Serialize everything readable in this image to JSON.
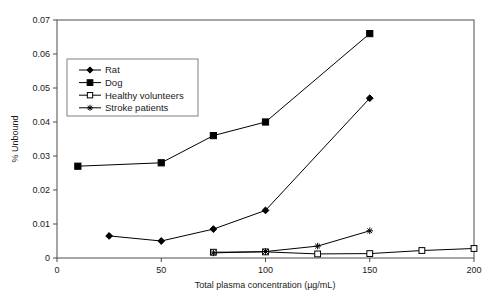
{
  "chart_data": {
    "type": "line",
    "title": "",
    "xlabel": "Total plasma concentration (µg/mL)",
    "ylabel": "% Unbound",
    "xlim": [
      0,
      200
    ],
    "ylim": [
      0,
      0.07
    ],
    "xticks": [
      "0",
      "50",
      "100",
      "150",
      "200"
    ],
    "xtick_values": [
      0,
      50,
      100,
      150,
      200
    ],
    "yticks": [
      "0",
      "0.01",
      "0.02",
      "0.03",
      "0.04",
      "0.05",
      "0.06",
      "0.07"
    ],
    "ytick_values": [
      0,
      0.01,
      0.02,
      0.03,
      0.04,
      0.05,
      0.06,
      0.07
    ],
    "grid": false,
    "legend_position": "upper left inside",
    "series": [
      {
        "name": "Rat",
        "marker": "filled-diamond",
        "color": "#000000",
        "x": [
          25,
          50,
          75,
          100,
          150
        ],
        "values": [
          0.0065,
          0.005,
          0.0085,
          0.014,
          0.047
        ]
      },
      {
        "name": "Dog",
        "marker": "filled-square",
        "color": "#000000",
        "x": [
          10,
          50,
          75,
          100,
          150
        ],
        "values": [
          0.027,
          0.028,
          0.036,
          0.04,
          0.066
        ]
      },
      {
        "name": "Healthy volunteers",
        "marker": "open-square",
        "color": "#000000",
        "x": [
          75,
          100,
          125,
          150,
          175,
          200
        ],
        "values": [
          0.0017,
          0.0018,
          0.0012,
          0.0013,
          0.0022,
          0.0028
        ]
      },
      {
        "name": "Stroke patients",
        "marker": "asterisk",
        "color": "#000000",
        "x": [
          75,
          100,
          125,
          150
        ],
        "values": [
          0.0015,
          0.0019,
          0.0035,
          0.008
        ]
      }
    ]
  },
  "legend": {
    "entries": [
      {
        "label": "Rat"
      },
      {
        "label": "Dog"
      },
      {
        "label": "Healthy volunteers"
      },
      {
        "label": "Stroke patients"
      }
    ]
  },
  "colors": {
    "axis": "#4d4d4d",
    "series": "#000000",
    "legend_border": "#808080",
    "background": "#ffffff"
  }
}
